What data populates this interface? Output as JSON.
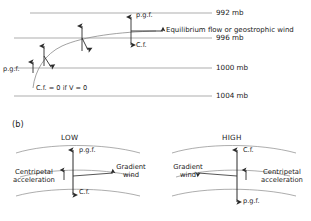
{
  "figure": {
    "panel_a": {
      "isobars": [
        {
          "label": "992 mb",
          "value": 992,
          "y": 13
        },
        {
          "label": "996 mb",
          "value": 996,
          "y": 38
        },
        {
          "label": "1000 mb",
          "value": 1000,
          "y": 68
        },
        {
          "label": "1004 mb",
          "value": 1004,
          "y": 96
        }
      ],
      "equilibrium_label": "Equilibrium flow or geostrophic wind",
      "pgf_label": "p.g.f.",
      "cf_label": "C.f.",
      "origin_pgf_label": "p.g.f.",
      "origin_note": "C.f. = 0  if  V = 0",
      "trajectory_note": "parcel path curving from rest toward geostrophic balance"
    },
    "panel_b": {
      "tag": "(b)",
      "low": {
        "center_label": "LOW",
        "pgf_label": "p.g.f.",
        "cf_label": "C.f.",
        "wind_label_line1": "Gradient",
        "wind_label_line2": "wind",
        "centripetal_line1": "Centripetal",
        "centripetal_line2": "acceleration"
      },
      "high": {
        "center_label": "HIGH",
        "pgf_label": "p.g.f.",
        "cf_label": "C.f.",
        "wind_label_line1": "Gradient",
        "wind_label_line2": "wind",
        "centripetal_line1": "Centripetal",
        "centripetal_line2": "acceleration"
      }
    },
    "colors": {
      "line": "#8a8a8a",
      "arrow": "#2b2b2b",
      "text": "#1a1a1a",
      "background": "#ffffff"
    }
  }
}
